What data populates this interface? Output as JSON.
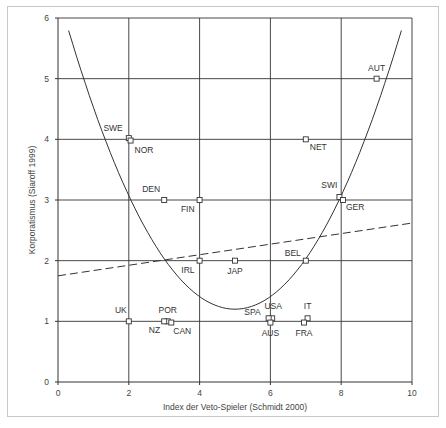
{
  "chart_data": {
    "type": "scatter",
    "title": "",
    "xlabel": "Index der Veto-Spieler (Schmidt 2000)",
    "ylabel": "Korporatismus (Siaroff 1999)",
    "xlim": [
      0,
      10
    ],
    "ylim": [
      0,
      6
    ],
    "xticks": [
      "0",
      "2",
      "4",
      "6",
      "8",
      "10"
    ],
    "yticks": [
      "0",
      "1",
      "2",
      "3",
      "4",
      "5",
      "6"
    ],
    "grid": true,
    "points": [
      {
        "label": "SWE",
        "x": 2.0,
        "y": 4.02
      },
      {
        "label": "NOR",
        "x": 2.05,
        "y": 3.98
      },
      {
        "label": "DEN",
        "x": 3.0,
        "y": 3.0
      },
      {
        "label": "FIN",
        "x": 4.0,
        "y": 3.0
      },
      {
        "label": "AUT",
        "x": 9.0,
        "y": 5.0
      },
      {
        "label": "NET",
        "x": 7.0,
        "y": 4.0
      },
      {
        "label": "SWI",
        "x": 7.95,
        "y": 3.05
      },
      {
        "label": "GER",
        "x": 8.05,
        "y": 3.0
      },
      {
        "label": "IRL",
        "x": 4.0,
        "y": 2.0
      },
      {
        "label": "JAP",
        "x": 5.0,
        "y": 2.0
      },
      {
        "label": "BEL",
        "x": 7.0,
        "y": 2.0
      },
      {
        "label": "UK",
        "x": 2.0,
        "y": 1.0
      },
      {
        "label": "POR",
        "x": 3.1,
        "y": 1.0
      },
      {
        "label": "NZ",
        "x": 3.0,
        "y": 1.0
      },
      {
        "label": "CAN",
        "x": 3.2,
        "y": 0.98
      },
      {
        "label": "USA",
        "x": 6.05,
        "y": 1.05
      },
      {
        "label": "SPA",
        "x": 5.95,
        "y": 1.05
      },
      {
        "label": "AUS",
        "x": 6.0,
        "y": 0.98
      },
      {
        "label": "IT",
        "x": 7.05,
        "y": 1.05
      },
      {
        "label": "FRA",
        "x": 6.95,
        "y": 0.98
      }
    ],
    "fits": [
      {
        "name": "quadratic fit",
        "style": "solid",
        "form": "y = 0.208*(x-5)^2 + 1.2",
        "x_range": [
          0.3,
          9.7
        ]
      },
      {
        "name": "linear fit",
        "style": "dashed",
        "x": [
          0,
          10
        ],
        "y": [
          1.75,
          2.62
        ]
      }
    ]
  },
  "colors": {
    "axis": "#333333",
    "grid": "#333333",
    "marker": "#333333",
    "curve": "#333333",
    "frame": "#c8c8c8"
  }
}
